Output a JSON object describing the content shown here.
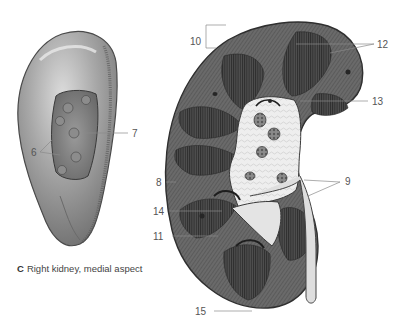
{
  "figure": {
    "panel_letter": "C",
    "caption": "Right kidney, medial aspect",
    "colors": {
      "background": "#ffffff",
      "kidney_surface": "#9a9a9a",
      "kidney_highlight": "#d4d4d4",
      "cortex": "#5e5e5e",
      "pyramid": "#3c3c3c",
      "sinus_fat": "#f0f0f0",
      "ureter": "#dcdcdc",
      "leader_line": "#8a8a8a",
      "label_text": "#555555"
    }
  },
  "labels": {
    "l6": "6",
    "l7": "7",
    "l8": "8",
    "l9": "9",
    "l10": "10",
    "l11": "11",
    "l12": "12",
    "l13": "13",
    "l14": "14",
    "l15": "15"
  }
}
